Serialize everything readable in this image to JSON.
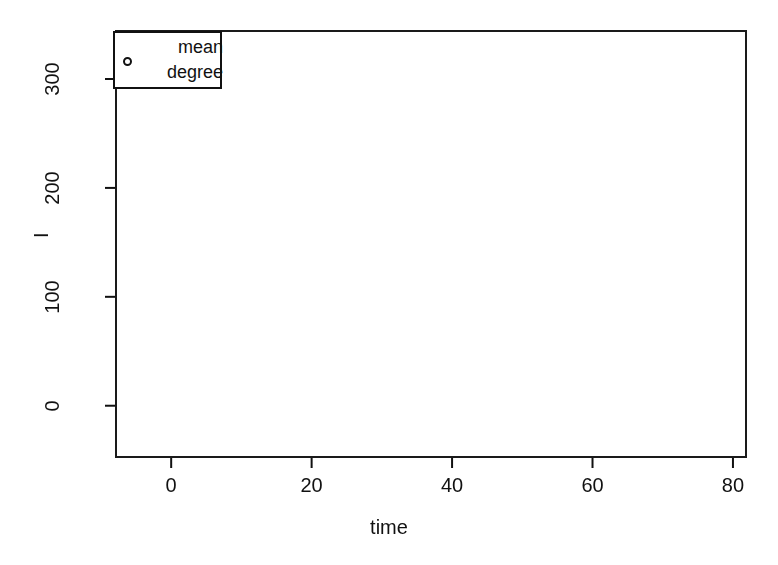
{
  "figure": {
    "background": "#ffffff",
    "ink_color": "#111111",
    "width": 778,
    "height": 565
  },
  "legend": {
    "name": "mean-degree-legend",
    "marker_shape": "circle-outline",
    "line1": "mean",
    "line2": "degree",
    "text": "mean degree"
  },
  "axes": {
    "x_title": "time",
    "y_title": "I",
    "x_ticks": [
      "0",
      "20",
      "40",
      "60",
      "80"
    ],
    "x_tick_values": [
      0,
      20,
      40,
      60,
      80
    ],
    "y_ticks": [
      "0",
      "100",
      "200",
      "300"
    ],
    "y_tick_values": [
      0,
      100,
      200,
      300
    ]
  },
  "chart_data": {
    "type": "scatter",
    "title": "",
    "subtitle": "",
    "xlabel": "time",
    "ylabel": "I",
    "xlim": [
      -8,
      82
    ],
    "ylim": [
      -48,
      345
    ],
    "grid": false,
    "legend_position": "top-left",
    "legend_entries": [
      "mean degree"
    ],
    "size_encoding": "mean degree (bubble radius)",
    "marker": "open circle",
    "series": [
      {
        "name": "infected vs time (bubble size = mean degree)",
        "x": [
          1,
          2,
          3,
          4,
          5,
          6,
          6.5,
          7.5,
          8,
          8.5,
          9,
          10,
          10.5,
          11,
          11.5,
          12,
          12.5,
          13,
          13.5,
          14,
          15,
          16,
          17,
          18,
          19,
          20,
          21,
          22,
          23,
          24,
          25,
          26,
          27,
          28,
          29,
          30,
          31,
          32,
          33,
          34,
          35,
          36,
          37,
          38,
          39,
          40,
          41,
          42,
          43,
          44,
          45,
          46,
          47,
          48,
          49,
          50,
          51,
          52,
          53,
          54,
          55,
          56,
          57,
          58,
          59,
          60,
          61,
          62,
          63,
          64,
          65,
          66,
          67,
          68,
          69,
          70
        ],
        "y": [
          1,
          2,
          4,
          8,
          14,
          30,
          55,
          135,
          240,
          297,
          303,
          307,
          308,
          310,
          309,
          303,
          300,
          296,
          290,
          282,
          268,
          252,
          238,
          222,
          207,
          190,
          175,
          163,
          150,
          138,
          125,
          112,
          103,
          95,
          88,
          80,
          73,
          67,
          61,
          56,
          51,
          47,
          43,
          39,
          35,
          31,
          28,
          25,
          23,
          21,
          19,
          18,
          17,
          16,
          15,
          14,
          13,
          12,
          11,
          10,
          9,
          9,
          8,
          8,
          7,
          7,
          6,
          6,
          5,
          5,
          4,
          4,
          3,
          3,
          3,
          2
        ],
        "size": [
          1.5,
          2.0,
          2.5,
          6.0,
          13.0,
          20.0,
          17.0,
          18.0,
          16.0,
          13.0,
          12.5,
          12.0,
          11.0,
          10.5,
          10.0,
          10.5,
          10.0,
          9.5,
          9.0,
          8.5,
          8.0,
          7.5,
          7.0,
          6.5,
          6.5,
          6.0,
          6.0,
          6.0,
          6.5,
          7.0,
          7.5,
          8.0,
          8.5,
          9.0,
          9.0,
          9.0,
          9.0,
          9.0,
          8.5,
          8.5,
          8.0,
          8.0,
          7.5,
          7.0,
          6.0,
          5.0,
          4.5,
          4.0,
          3.5,
          3.5,
          3.2,
          3.2,
          3.0,
          3.0,
          3.0,
          3.0,
          3.0,
          3.0,
          3.0,
          3.0,
          3.0,
          3.0,
          2.8,
          2.8,
          2.8,
          2.8,
          2.5,
          2.2,
          2.0,
          1.8,
          1.6,
          1.6,
          1.5,
          1.5,
          1.4,
          1.4
        ]
      }
    ]
  }
}
